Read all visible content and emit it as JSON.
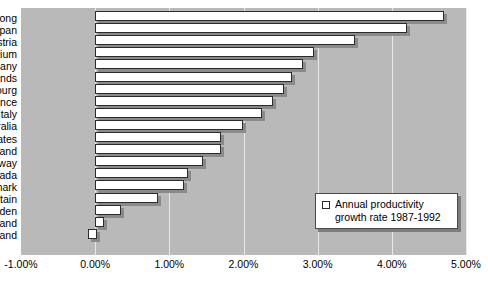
{
  "chart_data": {
    "type": "bar",
    "orientation": "horizontal",
    "title": "",
    "subtitle": "",
    "xlabel": "",
    "ylabel": "",
    "xlim": [
      -1.0,
      5.0
    ],
    "xtick_labels": [
      "-1.00%",
      "0.00%",
      "1.00%",
      "2.00%",
      "3.00%",
      "4.00%",
      "5.00%"
    ],
    "xtick_values": [
      -1.0,
      0.0,
      1.0,
      2.0,
      3.0,
      4.0,
      5.0
    ],
    "grid": true,
    "legend_position": "inside-bottom-right",
    "legend": [
      "Annual productivity growth rate 1987-1992"
    ],
    "categories": [
      "Hong Kong",
      "Japan",
      "Austria",
      "Belgium",
      "Germany",
      "Netherlands",
      "Luxembourg",
      "France",
      "Italy",
      "Australia",
      "United States",
      "Switzerland",
      "Norway",
      "Canada",
      "Denmark",
      "Britain",
      "Sweden",
      "Finland",
      "Iceland"
    ],
    "values": [
      4.7,
      4.2,
      3.5,
      2.95,
      2.8,
      2.65,
      2.55,
      2.4,
      2.25,
      2.0,
      1.7,
      1.7,
      1.45,
      1.25,
      1.2,
      0.85,
      0.35,
      0.1,
      0.12
    ],
    "value_start": [
      0,
      0,
      0,
      0,
      0,
      0,
      0,
      0,
      0,
      0,
      0,
      0,
      0,
      0,
      0,
      0,
      0,
      0,
      -0.1
    ],
    "series": [
      {
        "name": "Annual productivity growth rate 1987-1992",
        "values": [
          4.7,
          4.2,
          3.5,
          2.95,
          2.8,
          2.65,
          2.55,
          2.4,
          2.25,
          2.0,
          1.7,
          1.7,
          1.45,
          1.25,
          1.2,
          0.85,
          0.35,
          0.1,
          0.12
        ]
      }
    ]
  },
  "legend": {
    "line1": "Annual productivity",
    "line2": "growth rate 1987-1992",
    "swatch_name": "legend-swatch-bar"
  },
  "colors": {
    "plot_background": "#b9b9b9",
    "bar_fill": "#ffffff",
    "bar_border": "#2b2b2b",
    "bar_shadow": "#8a8a8a",
    "gridline": "#e9e9e9",
    "text": "#000000",
    "page_background": "#ffffff"
  }
}
